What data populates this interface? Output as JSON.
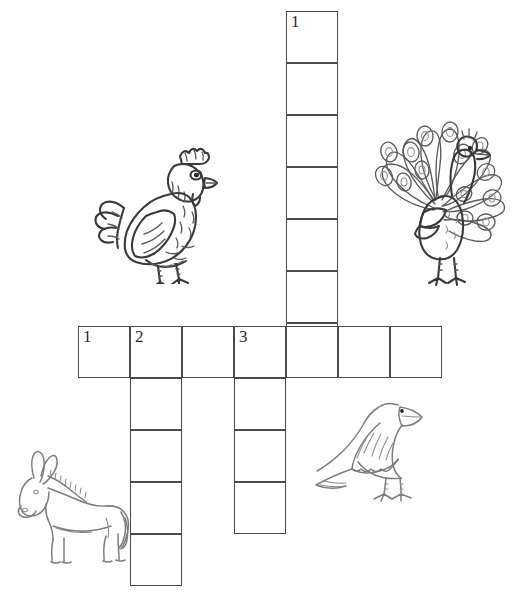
{
  "page": {
    "background_color": "#ffffff",
    "ink_color": "#3a3a3a",
    "grid_line_color": "#4a4a4a",
    "width": 512,
    "height": 605
  },
  "grid": {
    "cell_size": 52,
    "entries": [
      {
        "id": "down-1",
        "number": "1",
        "direction": "down",
        "length": 7,
        "start_x": 286,
        "start_y": 11,
        "cells": [
          "",
          "",
          "",
          "",
          "",
          "",
          ""
        ]
      },
      {
        "id": "across-1",
        "number": "1",
        "direction": "across",
        "length": 7,
        "start_x": 78,
        "start_y": 326,
        "cells": [
          "",
          "",
          "",
          "",
          "",
          "",
          ""
        ]
      },
      {
        "id": "down-2",
        "number": "2",
        "direction": "down",
        "length": 5,
        "start_x": 130,
        "start_y": 326,
        "cells": [
          "",
          "",
          "",
          "",
          ""
        ]
      },
      {
        "id": "down-3",
        "number": "3",
        "direction": "down",
        "length": 4,
        "start_x": 234,
        "start_y": 326,
        "cells": [
          "",
          "",
          "",
          ""
        ]
      }
    ],
    "numbered_cells": [
      {
        "label": "1",
        "entry": "down-1",
        "row": 0,
        "col": 0
      },
      {
        "label": "1",
        "entry": "across-1",
        "row": 0,
        "col": 0
      },
      {
        "label": "2",
        "entry": "across-1",
        "row": 0,
        "col": 1
      },
      {
        "label": "3",
        "entry": "across-1",
        "row": 0,
        "col": 3
      }
    ]
  },
  "illustrations": [
    {
      "id": "hen",
      "name": "hen-illustration",
      "label": "hen",
      "x": 88,
      "y": 138,
      "width": 136,
      "height": 146
    },
    {
      "id": "peacock",
      "name": "peacock-illustration",
      "label": "peacock",
      "x": 364,
      "y": 98,
      "width": 146,
      "height": 190
    },
    {
      "id": "donkey",
      "name": "donkey-illustration",
      "label": "donkey",
      "x": 8,
      "y": 448,
      "width": 126,
      "height": 116
    },
    {
      "id": "crow",
      "name": "crow-illustration",
      "label": "crow",
      "x": 302,
      "y": 385,
      "width": 136,
      "height": 126
    }
  ]
}
